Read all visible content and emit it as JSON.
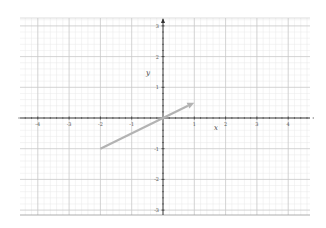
{
  "chart_data": {
    "type": "line",
    "title": "",
    "xlabel": "x",
    "ylabel": "y",
    "xlim": [
      -4.6,
      4.7
    ],
    "ylim": [
      -3.1,
      3.2
    ],
    "grid": true,
    "minor_grid": true,
    "x_ticks": [
      -4,
      -3,
      -2,
      -1,
      1,
      2,
      3,
      4
    ],
    "x_tick_labels": [
      "-4",
      "-3",
      "-2",
      "-1",
      "1",
      "2",
      "3",
      "4"
    ],
    "y_ticks": [
      3,
      2,
      1,
      -1,
      -2,
      -3
    ],
    "y_tick_labels": [
      "3",
      "2",
      "1",
      "-1",
      "-2",
      "-3"
    ],
    "series": [
      {
        "name": "vector",
        "kind": "arrow",
        "from": [
          -2,
          -1
        ],
        "to": [
          1,
          0.5
        ],
        "color": "#b3b3b3"
      }
    ],
    "colors": {
      "axis": "#333333",
      "major_grid": "#c8c8c8",
      "minor_grid": "#e8e8e8",
      "tick_label": "#555555"
    }
  }
}
